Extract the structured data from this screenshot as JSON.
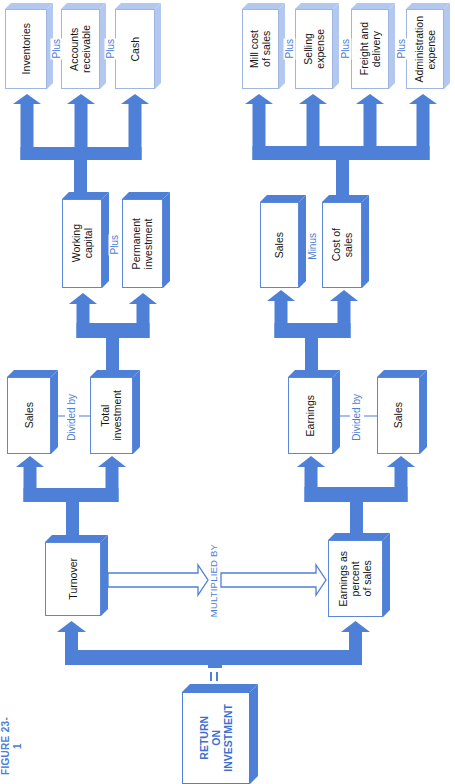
{
  "figure": {
    "label": "FIGURE 23-1"
  },
  "colors": {
    "accent": "#4d80d6",
    "pale_accent": "#b3c8ee",
    "text": "#161616"
  },
  "root": {
    "label": "RETURN\nON\nINVESTMENT",
    "equals": "="
  },
  "multiplied_by": "MULTIPLIED BY",
  "turnover_branch": {
    "turnover": "Turnover",
    "sales": "Sales",
    "divided_by": "Divided by",
    "total_investment": "Total\ninvestment",
    "working_capital": "Working\ncapital",
    "plus": "Plus",
    "permanent_investment": "Permanent\ninvestment",
    "inventories": "Inventories",
    "plus_1": "Plus",
    "accounts_receivable": "Accounts\nreceivable",
    "plus_2": "Plus",
    "cash": "Cash"
  },
  "earnings_branch": {
    "earnings_pct": "Earnings as\npercent\nof sales",
    "earnings": "Earnings",
    "divided_by": "Divided by",
    "sales": "Sales",
    "sales_top": "Sales",
    "minus": "Minus",
    "cost_of_sales": "Cost of\nsales",
    "mill_cost": "Mill cost\nof sales",
    "plus_1": "Plus",
    "selling_expense": "Selling\nexpense",
    "plus_2": "Plus",
    "freight": "Freight and\ndelivery",
    "plus_3": "Plus",
    "administration": "Administration\nexpense"
  }
}
